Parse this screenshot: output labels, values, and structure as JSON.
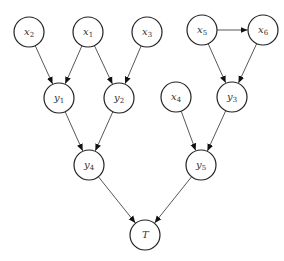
{
  "diagram": {
    "type": "directed-graph",
    "nodes": [
      {
        "id": "x2",
        "base": "x",
        "sub": "2",
        "cx": 29,
        "cy": 32
      },
      {
        "id": "x1",
        "base": "x",
        "sub": "1",
        "cx": 88,
        "cy": 32
      },
      {
        "id": "x3",
        "base": "x",
        "sub": "3",
        "cx": 147,
        "cy": 32
      },
      {
        "id": "x5",
        "base": "x",
        "sub": "5",
        "cx": 202,
        "cy": 30
      },
      {
        "id": "x6",
        "base": "x",
        "sub": "6",
        "cx": 263,
        "cy": 30
      },
      {
        "id": "y1",
        "base": "y",
        "sub": "1",
        "cx": 59,
        "cy": 98
      },
      {
        "id": "y2",
        "base": "y",
        "sub": "2",
        "cx": 119,
        "cy": 98
      },
      {
        "id": "x4",
        "base": "x",
        "sub": "4",
        "cx": 176,
        "cy": 97
      },
      {
        "id": "y3",
        "base": "y",
        "sub": "3",
        "cx": 232,
        "cy": 97
      },
      {
        "id": "y4",
        "base": "y",
        "sub": "4",
        "cx": 89,
        "cy": 165
      },
      {
        "id": "y5",
        "base": "y",
        "sub": "5",
        "cx": 201,
        "cy": 165
      },
      {
        "id": "T",
        "base": "T",
        "sub": "",
        "cx": 145,
        "cy": 235
      }
    ],
    "edges": [
      [
        "x2",
        "y1"
      ],
      [
        "x1",
        "y1"
      ],
      [
        "x1",
        "y2"
      ],
      [
        "x3",
        "y2"
      ],
      [
        "x5",
        "x6"
      ],
      [
        "x5",
        "y3"
      ],
      [
        "x6",
        "y3"
      ],
      [
        "y1",
        "y4"
      ],
      [
        "y2",
        "y4"
      ],
      [
        "x4",
        "y5"
      ],
      [
        "y3",
        "y5"
      ],
      [
        "y4",
        "T"
      ],
      [
        "y5",
        "T"
      ]
    ],
    "node_radius": 15,
    "colors": {
      "stroke": "#222222",
      "edge": "#444444",
      "fill": "#ffffff"
    }
  }
}
